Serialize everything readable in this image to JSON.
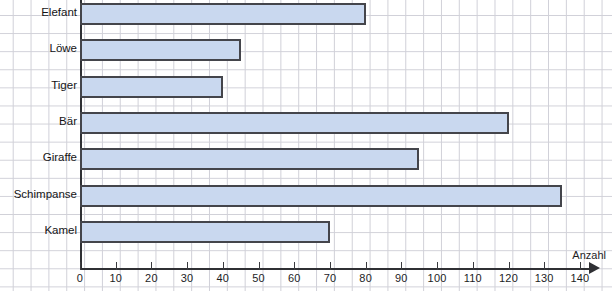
{
  "chart_data": {
    "type": "bar",
    "orientation": "horizontal",
    "title": "",
    "xlabel": "Anzahl",
    "ylabel": "",
    "categories": [
      "Elefant",
      "Löwe",
      "Tiger",
      "Bär",
      "Giraffe",
      "Schimpanse",
      "Kamel"
    ],
    "values": [
      80,
      45,
      40,
      120,
      95,
      135,
      70
    ],
    "xlim": [
      0,
      140
    ],
    "xticks": [
      0,
      10,
      20,
      30,
      40,
      50,
      60,
      70,
      80,
      90,
      100,
      110,
      120,
      130,
      140
    ],
    "xtick_labels": [
      "0",
      "10",
      "20",
      "30",
      "40",
      "50",
      "60",
      "70",
      "80",
      "90",
      "100",
      "110",
      "120",
      "130",
      "140"
    ],
    "grid": true,
    "legend": false,
    "bar_fill_color": "#c9d8ef",
    "bar_border_color": "#44454b",
    "grid_color": "#c9c9d2",
    "axis_color": "#2f3034",
    "background_color": "#ffffff"
  },
  "axis": {
    "x_title": "Anzahl"
  }
}
